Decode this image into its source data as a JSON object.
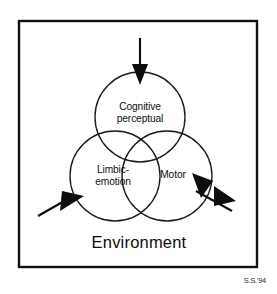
{
  "figure": {
    "background_color": "#ffffff",
    "ink_color": "#0d0d0d",
    "frame": {
      "name": "environment-frame",
      "stroke_color": "#111111"
    },
    "environment_label": "Environment",
    "signature": "S.S.'94",
    "circles": [
      {
        "id": "cognitive",
        "label_line1": "Cognitive",
        "label_line2": "perceptual",
        "cx": 140,
        "cy": 117,
        "r": 45
      },
      {
        "id": "limbic",
        "label_line1": "Limbic-",
        "label_line2": "emotion",
        "cx": 115,
        "cy": 176,
        "r": 45
      },
      {
        "id": "motor",
        "label_line1": "Motor",
        "label_line2": "",
        "cx": 167,
        "cy": 176,
        "r": 45
      }
    ],
    "arrows": [
      {
        "id": "input-top",
        "direction": "down",
        "target": "cognitive",
        "heads": 1
      },
      {
        "id": "input-limbic",
        "direction": "up-right",
        "target": "limbic",
        "heads": 1
      },
      {
        "id": "output-motor",
        "direction": "bidirectional",
        "target": "motor",
        "heads": 2
      }
    ]
  }
}
